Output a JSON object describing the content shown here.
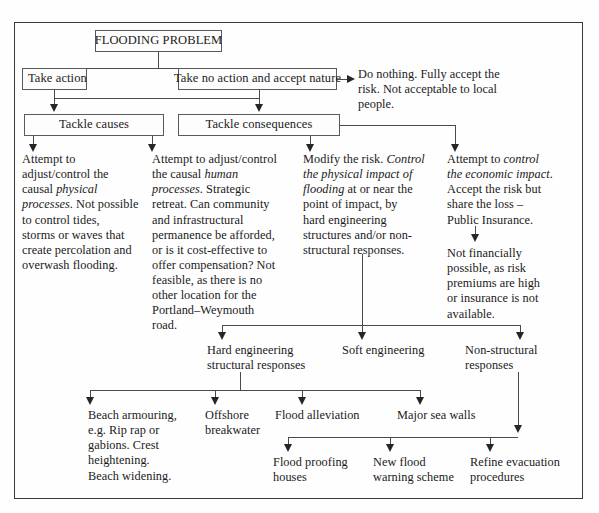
{
  "diagram": {
    "title_box": {
      "label": "FLOODING PROBLEM"
    },
    "level2": [
      {
        "label": "Take action"
      },
      {
        "label": "Take no action and accept nature"
      }
    ],
    "level3": [
      {
        "label": "Tackle causes"
      },
      {
        "label": "Tackle consequences"
      }
    ],
    "do_nothing": {
      "text": "Do nothing. Fully accept the\nrisk. Not acceptable to local\npeople."
    },
    "columns": [
      {
        "name": "physical-processes",
        "text_plain": "Attempt to\nadjust/control the\ncausal physical\nprocesses. Not possible\nto control tides,\nstorms or waves that\ncreate percolation and\noverwash flooding.",
        "segments": [
          {
            "t": "Attempt to\nadjust/control the\ncausal ",
            "i": false
          },
          {
            "t": "physical\nprocesses",
            "i": true
          },
          {
            "t": ". Not possible\nto control tides,\nstorms or waves that\ncreate percolation and\noverwash flooding.",
            "i": false
          }
        ]
      },
      {
        "name": "human-processes",
        "text_plain": "Attempt to adjust/control\nthe causal human\nprocesses. Strategic\nretreat. Can community\nand infrastructural\npermanence be afforded,\nor is it cost-effective to\noffer compensation? Not\nfeasible, as there is no\nother location for the\nPortland–Weymouth\nroad.",
        "segments": [
          {
            "t": "Attempt to adjust/control\nthe causal ",
            "i": false
          },
          {
            "t": "human\nprocesses",
            "i": true
          },
          {
            "t": ". Strategic\nretreat. Can community\nand infrastructural\npermanence be afforded,\nor is it cost-effective to\noffer compensation? Not\nfeasible, as there is no\nother location for the\nPortland–Weymouth\nroad.",
            "i": false
          }
        ]
      },
      {
        "name": "modify-the-risk",
        "text_plain": "Modify the risk. Control\nthe physical impact of\nflooding at or near the\npoint of impact, by\nhard engineering\nstructures and/or non-\nstructural responses.",
        "segments": [
          {
            "t": "Modify the risk. ",
            "i": false
          },
          {
            "t": "Control\nthe physical impact of\nflooding",
            "i": true
          },
          {
            "t": " at or near the\npoint of impact, by\nhard engineering\nstructures and/or non-\nstructural responses.",
            "i": false
          }
        ]
      },
      {
        "name": "economic-impact",
        "text_plain": "Attempt to control\nthe economic impact.\nAccept the risk but\nshare the loss –\nPublic Insurance.",
        "segments": [
          {
            "t": "Attempt to ",
            "i": false
          },
          {
            "t": "control\nthe economic impact",
            "i": true
          },
          {
            "t": ".\nAccept the risk but\nshare the loss –\nPublic Insurance.",
            "i": false
          }
        ]
      }
    ],
    "not_financially": {
      "text": "Not financially\npossible, as risk\npremiums are high\nor insurance is not\navailable."
    },
    "level4": [
      {
        "name": "hard-engineering",
        "text": "Hard engineering\nstructural responses"
      },
      {
        "name": "soft-engineering",
        "text": "Soft engineering"
      },
      {
        "name": "non-structural",
        "text": "Non-structural\nresponses"
      }
    ],
    "level5": [
      {
        "name": "beach-armouring",
        "text": "Beach armouring,\ne.g. Rip rap or\ngabions. Crest\nheightening.\nBeach widening."
      },
      {
        "name": "offshore-breakwater",
        "text": "Offshore\nbreakwater"
      },
      {
        "name": "flood-alleviation",
        "text": "Flood alleviation"
      },
      {
        "name": "major-sea-walls",
        "text": "Major sea walls"
      }
    ],
    "level6": [
      {
        "name": "flood-proofing-houses",
        "text": "Flood proofing\nhouses"
      },
      {
        "name": "new-flood-warning-scheme",
        "text": "New flood\nwarning scheme"
      },
      {
        "name": "refine-evacuation-procedures",
        "text": "Refine evacuation\nprocedures"
      }
    ]
  },
  "colors": {
    "line": "#4a4a4a",
    "arrow": "#262626",
    "border": "#5a5a5a",
    "frame": "#3a3a3a",
    "text": "#1a1a1a",
    "background": "#fefefe"
  }
}
